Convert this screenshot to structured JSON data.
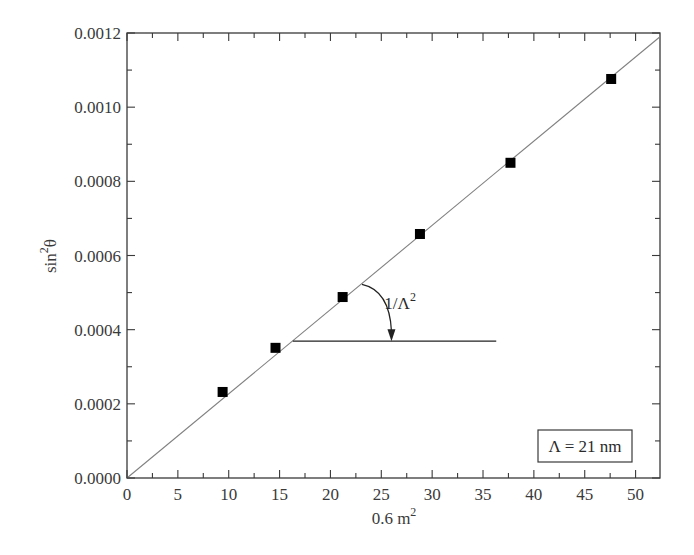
{
  "chart_data": {
    "type": "scatter",
    "title": "",
    "xlabel": "0.6 m",
    "xlabel_sup": "2",
    "ylabel": "sin",
    "ylabel_sup": "2",
    "ylabel_tail": "θ",
    "xlim": [
      0,
      52.4
    ],
    "ylim": [
      0,
      0.0012
    ],
    "grid": false,
    "x_ticks": [
      0,
      5,
      10,
      15,
      20,
      25,
      30,
      35,
      40,
      45,
      50
    ],
    "x_tick_labels": [
      "0",
      "5",
      "10",
      "15",
      "20",
      "25",
      "30",
      "35",
      "40",
      "45",
      "50"
    ],
    "y_ticks": [
      0,
      0.0002,
      0.0004,
      0.0006,
      0.0008,
      0.001,
      0.0012
    ],
    "y_tick_labels": [
      "0.0000",
      "0.0002",
      "0.0004",
      "0.0006",
      "0.0008",
      "0.0010",
      "0.0012"
    ],
    "series": [
      {
        "name": "data",
        "marker": "square",
        "color": "#000000",
        "x": [
          9.4,
          14.6,
          21.2,
          28.8,
          37.7,
          47.6
        ],
        "y": [
          0.000232,
          0.000351,
          0.000488,
          0.000658,
          0.00085,
          0.001076
        ]
      },
      {
        "name": "linear fit",
        "style": "line",
        "color": "#808080",
        "x": [
          0,
          52.4
        ],
        "y": [
          0,
          0.00119
        ]
      }
    ],
    "annotations": [
      {
        "type": "text",
        "text": "1/Λ",
        "sup": "2",
        "x": 25.3,
        "y": 0.000455
      },
      {
        "type": "hline",
        "x0": 16.3,
        "x1": 36.3,
        "y": 0.000369
      },
      {
        "type": "arc-arrow",
        "from": [
          23.1,
          0.000522
        ],
        "to": [
          26.0,
          0.000369
        ]
      }
    ],
    "legend": {
      "text": "Λ = 21 nm",
      "position": "lower right"
    }
  }
}
